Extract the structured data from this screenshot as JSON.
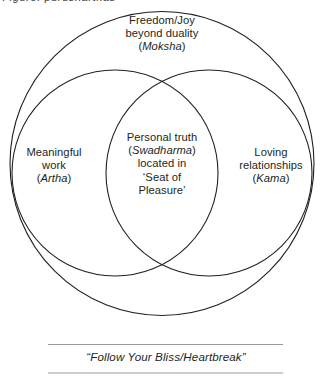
{
  "diagram": {
    "title_partial_cropped": "Figure: purusharthas",
    "background_color": "#ffffff",
    "stroke_color": "#231f20",
    "rule_color": "#9a9a9a",
    "circles": {
      "outer": {
        "label_ref": "moksha",
        "cx": 162,
        "cy": 163,
        "r": 152
      },
      "left": {
        "label_ref": "artha",
        "cx": 115,
        "cy": 173,
        "r": 103
      },
      "right": {
        "label_ref": "kama",
        "cx": 209,
        "cy": 173,
        "r": 103
      }
    },
    "labels": {
      "moksha": {
        "line1": "Freedom/Joy",
        "line2": "beyond duality",
        "sanskrit": "Moksha",
        "paren_open": "(",
        "paren_close": ")"
      },
      "artha": {
        "line1": "Meaningful",
        "line2": "work",
        "sanskrit": "Artha",
        "paren_open": "(",
        "paren_close": ")"
      },
      "kama": {
        "line1": "Loving",
        "line2": "relationships",
        "sanskrit": "Kama",
        "paren_open": "(",
        "paren_close": ")"
      },
      "swadharma": {
        "line1": "Personal truth",
        "sanskrit": "Swadharma",
        "paren_open": "(",
        "paren_close": ")",
        "line3": "located in",
        "line4": "‘Seat of",
        "line5": "Pleasure’"
      }
    },
    "caption": {
      "text": "“Follow Your Bliss/Heartbreak”"
    }
  }
}
